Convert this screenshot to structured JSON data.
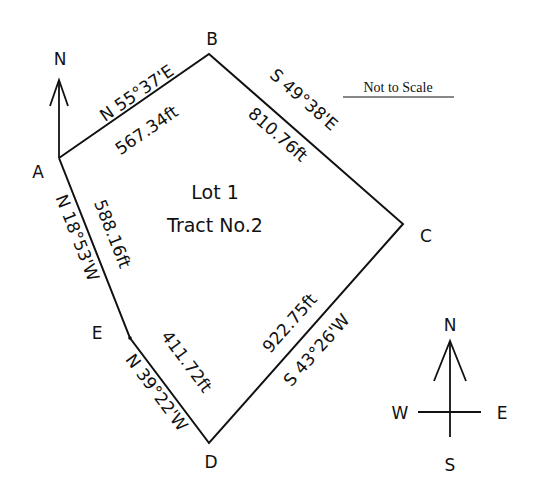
{
  "diagram": {
    "title_line1": "Lot 1",
    "title_line2": "Tract No.2",
    "note": "Not to Scale",
    "line_color": "#111111",
    "background": "#ffffff",
    "vertices": {
      "A": {
        "label": "A",
        "x": 59,
        "y": 158
      },
      "B": {
        "label": "B",
        "x": 209,
        "y": 54
      },
      "C": {
        "label": "C",
        "x": 403,
        "y": 224
      },
      "D": {
        "label": "D",
        "x": 209,
        "y": 443
      },
      "E": {
        "label": "E",
        "x": 130,
        "y": 338
      }
    },
    "courses": [
      {
        "from": "A",
        "to": "B",
        "bearing": "N 55°37'E",
        "distance": "567.34ft"
      },
      {
        "from": "B",
        "to": "C",
        "bearing": "S 49°38'E",
        "distance": "810.76ft"
      },
      {
        "from": "C",
        "to": "D",
        "bearing": "S 43°26'W",
        "distance": "922.75ft"
      },
      {
        "from": "D",
        "to": "E",
        "bearing": "N 39°22'W",
        "distance": "411.72ft"
      },
      {
        "from": "E",
        "to": "A",
        "bearing": "N 18°53'W",
        "distance": "588.16ft"
      }
    ],
    "north_arrow": {
      "label": "N"
    },
    "compass": {
      "n": "N",
      "s": "S",
      "e": "E",
      "w": "W"
    }
  }
}
